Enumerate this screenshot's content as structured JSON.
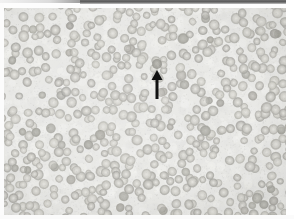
{
  "figure": {
    "kind": "light-microscopy-photomicrograph",
    "caption": "",
    "background_color": "#e9e9e6",
    "plate": {
      "x": 4,
      "y": 8,
      "width": 282,
      "height": 207
    }
  },
  "top_band": {
    "name": "scan-edge-band",
    "color": "#5a5a5a",
    "x": 80,
    "y": 0,
    "width": 214,
    "height": 4
  },
  "annotation": {
    "type": "arrow",
    "direction": "up",
    "color": "#111111",
    "tip_x": 157,
    "tip_y": 70,
    "tail_y": 99,
    "shaft_width": 3,
    "head_width": 11,
    "head_height": 10,
    "points_at": "highlighted-cell"
  },
  "cells": {
    "label": "red blood cells",
    "fill_color": "#c9c8c2",
    "rim_color": "#a9a8a2",
    "pallor_color": "#e4e3de",
    "mean_diameter_px": 9,
    "count": 560
  },
  "highlighted_cell": {
    "x": 157,
    "y": 64,
    "diameter_px": 10,
    "fill_color": "#9b9a93"
  }
}
